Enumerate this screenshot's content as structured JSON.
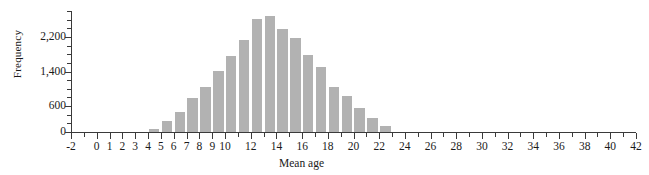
{
  "chart_data": {
    "type": "bar",
    "title": "",
    "subtitle": "",
    "xlabel": "Mean age",
    "ylabel": "Frequency",
    "grid": false,
    "legend": "none",
    "xlim": [
      -2,
      42
    ],
    "ylim": [
      0,
      2800
    ],
    "x_tick_labels": [
      "-2",
      "0",
      "1",
      "2",
      "3",
      "4",
      "5",
      "6",
      "7",
      "8",
      "9",
      "10",
      "12",
      "14",
      "16",
      "18",
      "20",
      "22",
      "24",
      "26",
      "28",
      "30",
      "32",
      "34",
      "36",
      "38",
      "40",
      "42"
    ],
    "x_tick_values": [
      -2,
      0,
      1,
      2,
      3,
      4,
      5,
      6,
      7,
      8,
      9,
      10,
      12,
      14,
      16,
      18,
      20,
      22,
      24,
      26,
      28,
      30,
      32,
      34,
      36,
      38,
      40,
      42
    ],
    "y_tick_labels": [
      "0",
      "600",
      "1,400",
      "2,200"
    ],
    "y_tick_values": [
      0,
      600,
      1400,
      2200
    ],
    "y_minor_tick_values": [
      200,
      400,
      800,
      1000,
      1200,
      1600,
      1800,
      2000,
      2400,
      2600,
      2800
    ],
    "bin_width": 1,
    "bar_color": "#b2b2b2",
    "axis_color": "#3a3a3a",
    "categories": [
      "4-5",
      "5-6",
      "6-7",
      "7-8",
      "8-9",
      "9-10",
      "10-11",
      "11-12",
      "12-13",
      "13-14",
      "14-15",
      "15-16",
      "16-17",
      "17-18",
      "18-19",
      "19-20",
      "20-21",
      "21-22",
      "22-23"
    ],
    "bin_starts": [
      4,
      5,
      6,
      7,
      8,
      9,
      10,
      11,
      12,
      13,
      14,
      15,
      16,
      17,
      18,
      19,
      20,
      21,
      22
    ],
    "values": [
      80,
      260,
      460,
      780,
      1030,
      1420,
      1750,
      2120,
      2620,
      2680,
      2380,
      2180,
      1790,
      1500,
      1030,
      830,
      560,
      330,
      130
    ]
  }
}
